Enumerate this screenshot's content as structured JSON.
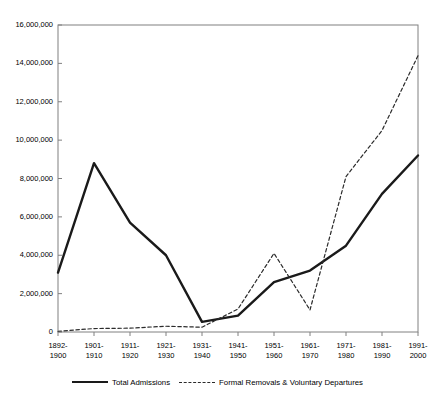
{
  "chart_data": {
    "type": "line",
    "title": "",
    "xlabel": "",
    "ylabel": "",
    "ylim": [
      0,
      16000000
    ],
    "grid": false,
    "legend_position": "bottom",
    "categories": [
      "1892-1900",
      "1901-1910",
      "1911-1920",
      "1921-1930",
      "1931-1940",
      "1941-1950",
      "1951-1960",
      "1961-1970",
      "1971-1980",
      "1981-1990",
      "1991-2000"
    ],
    "category_lines": [
      [
        "1892-",
        "1900"
      ],
      [
        "1901-",
        "1910"
      ],
      [
        "1911-",
        "1920"
      ],
      [
        "1921-",
        "1930"
      ],
      [
        "1931-",
        "1940"
      ],
      [
        "1941-",
        "1950"
      ],
      [
        "1951-",
        "1960"
      ],
      [
        "1961-",
        "1970"
      ],
      [
        "1971-",
        "1980"
      ],
      [
        "1981-",
        "1990"
      ],
      [
        "1991-",
        "2000"
      ]
    ],
    "ytick_values": [
      0,
      2000000,
      4000000,
      6000000,
      8000000,
      10000000,
      12000000,
      14000000,
      16000000
    ],
    "ytick_labels": [
      "0",
      "2,000,000",
      "4,000,000",
      "6,000,000",
      "8,000,000",
      "10,000,000",
      "12,000,000",
      "14,000,000",
      "16,000,000"
    ],
    "series": [
      {
        "name": "Total Admissions",
        "style": "solid",
        "color": "#1a1a1a",
        "width": 2.4,
        "values": [
          3100000,
          8800000,
          5700000,
          4000000,
          530000,
          850000,
          2600000,
          3200000,
          4500000,
          7200000,
          9200000
        ]
      },
      {
        "name": "Formal Removals & Voluntary Departures",
        "style": "dashed",
        "color": "#2b2b2b",
        "width": 1.2,
        "values": [
          40000,
          180000,
          200000,
          300000,
          250000,
          1200000,
          4100000,
          1150000,
          8100000,
          10500000,
          14400000
        ]
      }
    ]
  },
  "legend": {
    "items": [
      {
        "label": "Total Admissions",
        "style": "solid"
      },
      {
        "label": "Formal Removals & Voluntary Departures",
        "style": "dashed"
      }
    ]
  }
}
